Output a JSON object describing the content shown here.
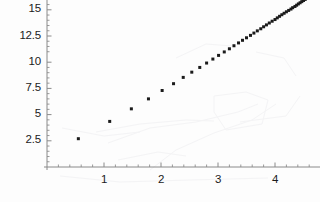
{
  "figure": {
    "background_color": "#fdfdfd",
    "ink_color": "#1b1b1b",
    "axis_color": "#8a8a8a",
    "artifact_color": "#ededf0"
  },
  "chart_data": {
    "type": "scatter",
    "title": "",
    "subtitle": "",
    "xlabel": "",
    "ylabel": "",
    "xlim": [
      0,
      4.8
    ],
    "ylim": [
      0,
      17.0
    ],
    "grid": false,
    "legend": null,
    "legend_position": "none",
    "x_ticks": [
      1,
      2,
      3,
      4
    ],
    "x_tick_labels": [
      "1",
      "2",
      "3",
      "4"
    ],
    "y_ticks": [
      2.5,
      5,
      7.5,
      10,
      12.5,
      15
    ],
    "y_tick_labels": [
      "2.5",
      "5",
      "7.5",
      "10",
      "12.5",
      "15"
    ],
    "x_minor_ticks": [
      0.2,
      0.4,
      0.6,
      0.8,
      1.2,
      1.4,
      1.6,
      1.8,
      2.2,
      2.4,
      2.6,
      2.8,
      3.2,
      3.4,
      3.6,
      3.8,
      4.2,
      4.4,
      4.6
    ],
    "y_minor_ticks": [
      0.5,
      1.0,
      1.5,
      2.0,
      3.0,
      3.5,
      4.0,
      4.5,
      5.5,
      6.0,
      6.5,
      7.0,
      8.0,
      8.5,
      9.0,
      9.5,
      11.0,
      11.5,
      12.0,
      13.0,
      13.5,
      14.0,
      14.5,
      15.5,
      16.0,
      16.5
    ],
    "marker": "square",
    "marker_size": 3,
    "marker_color": "#1b1b1b",
    "series": [
      {
        "name": "data",
        "x": [
          0.55,
          1.1,
          1.48,
          1.78,
          2.02,
          2.22,
          2.39,
          2.54,
          2.68,
          2.8,
          2.91,
          3.01,
          3.11,
          3.2,
          3.28,
          3.36,
          3.43,
          3.5,
          3.57,
          3.63,
          3.69,
          3.75,
          3.8,
          3.85,
          3.9,
          3.95,
          4.0,
          4.04,
          4.08,
          4.12,
          4.16,
          4.2,
          4.24,
          4.28,
          4.31,
          4.35,
          4.38,
          4.41,
          4.44,
          4.47,
          4.5,
          4.53,
          4.56,
          4.59,
          4.62,
          4.64,
          4.67,
          4.7,
          4.72,
          4.75
        ],
        "y": [
          2.7,
          4.35,
          5.55,
          6.5,
          7.3,
          7.95,
          8.55,
          9.05,
          9.5,
          9.92,
          10.3,
          10.65,
          10.98,
          11.28,
          11.57,
          11.84,
          12.09,
          12.33,
          12.56,
          12.78,
          12.99,
          13.19,
          13.38,
          13.56,
          13.74,
          13.91,
          14.07,
          14.23,
          14.38,
          14.53,
          14.67,
          14.81,
          14.94,
          15.07,
          15.2,
          15.32,
          15.44,
          15.56,
          15.67,
          15.78,
          15.89,
          15.99,
          16.09,
          16.19,
          16.29,
          16.38,
          16.48,
          16.57,
          16.66,
          16.74
        ]
      }
    ]
  },
  "artifacts": {
    "description": "faint light-gray scanner smudges and pencil-like strokes behind the plot",
    "strokes": [
      "M 108 143 L 150 128 L 196 122 L 238 112 L 258 104",
      "M 96 132 L 140 124 L 186 120 L 214 121",
      "M 150 170 L 176 150 L 214 133 L 252 120 L 276 104",
      "M 214 96 L 246 92 L 268 100 L 262 124 L 226 130 L 214 112 Z",
      "M 62 128 L 104 136 L 140 132",
      "M 176 58 L 206 44 L 232 46",
      "M 240 122 L 286 116 L 300 96",
      "M 118 160 L 158 152 L 186 156",
      "M 256 52 L 284 58 L 296 76",
      "M 60 176 L 120 182 L 190 180 L 268 178"
    ]
  }
}
